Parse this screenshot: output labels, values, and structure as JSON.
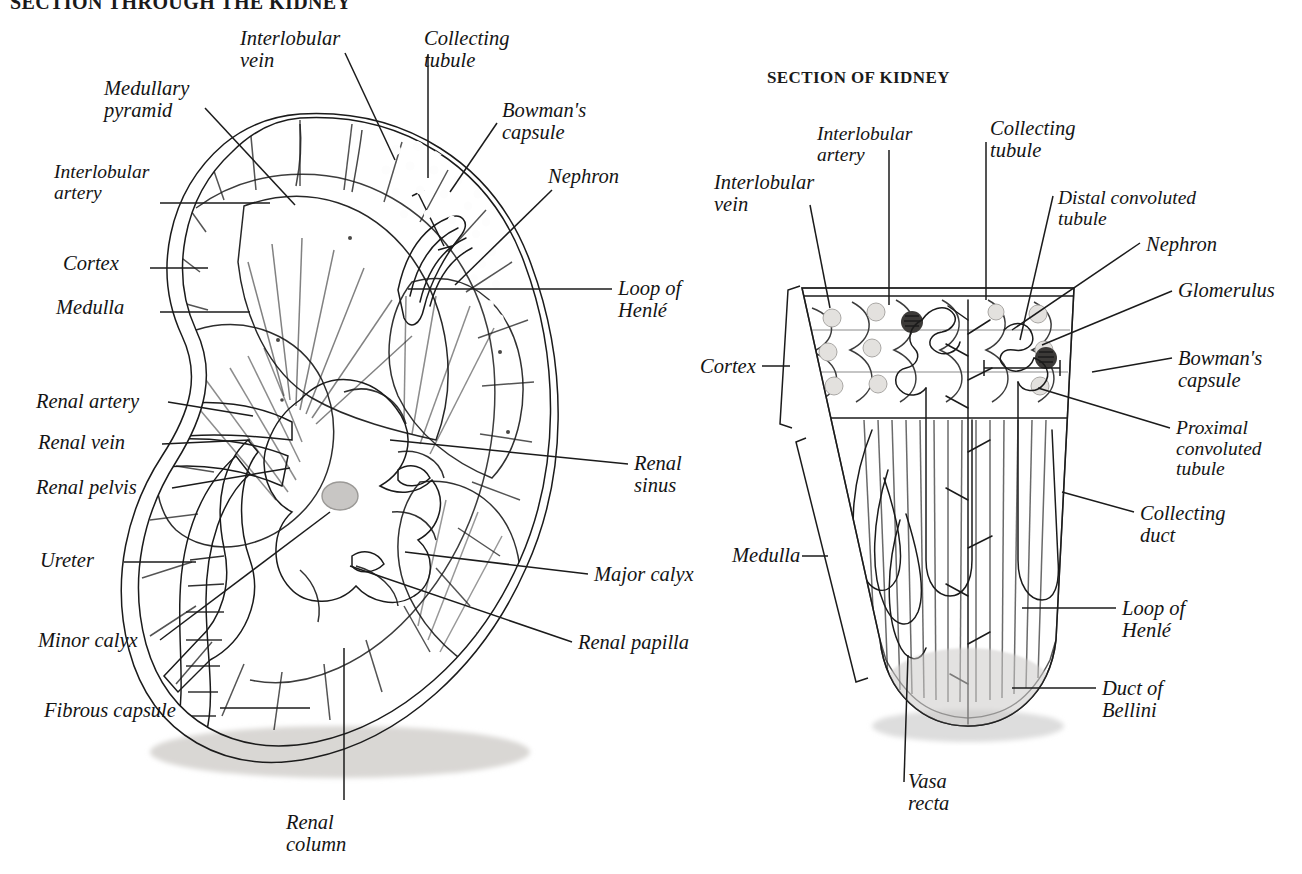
{
  "page": {
    "title_left": "SECTION THROUGH THE KIDNEY",
    "title_right": "SECTION OF KIDNEY",
    "background": "#ffffff",
    "ink": "#141414"
  },
  "left_figure": {
    "name": "whole-kidney-coronal-section",
    "labels": [
      {
        "id": "interlobular-vein",
        "text": "Interlobular\nvein",
        "x": 240,
        "y": 28,
        "align": "left"
      },
      {
        "id": "collecting-tubule",
        "text": "Collecting\ntubule",
        "x": 424,
        "y": 28,
        "align": "left"
      },
      {
        "id": "medullary-pyramid",
        "text": "Medullary\npyramid",
        "x": 104,
        "y": 78,
        "align": "left"
      },
      {
        "id": "bowmans-capsule",
        "text": "Bowman's\ncapsule",
        "x": 502,
        "y": 100,
        "align": "left"
      },
      {
        "id": "interlobular-artery",
        "text": "Interlobular\nartery",
        "x": 54,
        "y": 162,
        "align": "left"
      },
      {
        "id": "nephron",
        "text": "Nephron",
        "x": 548,
        "y": 166,
        "align": "left"
      },
      {
        "id": "cortex",
        "text": "Cortex",
        "x": 63,
        "y": 253,
        "align": "left"
      },
      {
        "id": "medulla",
        "text": "Medulla",
        "x": 56,
        "y": 297,
        "align": "left"
      },
      {
        "id": "loop-of-henle",
        "text": "Loop of\nHenlé",
        "x": 618,
        "y": 278,
        "align": "left"
      },
      {
        "id": "renal-artery",
        "text": "Renal artery",
        "x": 36,
        "y": 391,
        "align": "left"
      },
      {
        "id": "renal-vein",
        "text": "Renal vein",
        "x": 38,
        "y": 432,
        "align": "left"
      },
      {
        "id": "renal-sinus",
        "text": "Renal\nsinus",
        "x": 634,
        "y": 453,
        "align": "left"
      },
      {
        "id": "renal-pelvis",
        "text": "Renal pelvis",
        "x": 36,
        "y": 477,
        "align": "left"
      },
      {
        "id": "ureter",
        "text": "Ureter",
        "x": 40,
        "y": 550,
        "align": "left"
      },
      {
        "id": "major-calyx",
        "text": "Major calyx",
        "x": 594,
        "y": 564,
        "align": "left"
      },
      {
        "id": "minor-calyx",
        "text": "Minor calyx",
        "x": 38,
        "y": 630,
        "align": "left"
      },
      {
        "id": "renal-papilla",
        "text": "Renal papilla",
        "x": 578,
        "y": 632,
        "align": "left"
      },
      {
        "id": "fibrous-capsule",
        "text": "Fibrous capsule",
        "x": 44,
        "y": 700,
        "align": "left"
      },
      {
        "id": "renal-column",
        "text": "Renal\ncolumn",
        "x": 286,
        "y": 812,
        "align": "left"
      }
    ],
    "leaders": [
      {
        "for": "interlobular-vein",
        "points": "345,53 395,160"
      },
      {
        "for": "collecting-tubule",
        "points": "428,54 428,178"
      },
      {
        "for": "medullary-pyramid",
        "points": "205,108 295,205"
      },
      {
        "for": "bowmans-capsule",
        "points": "497,123 450,192"
      },
      {
        "for": "interlobular-artery",
        "points": "160,203 270,203"
      },
      {
        "for": "nephron",
        "points": "552,190 455,285"
      },
      {
        "for": "cortex",
        "points": "150,268 208,268"
      },
      {
        "for": "medulla",
        "points": "160,312 250,312"
      },
      {
        "for": "loop-of-henle",
        "points": "612,289 408,289"
      },
      {
        "for": "renal-artery",
        "points": "168,402 253,416"
      },
      {
        "for": "renal-vein",
        "points": "162,444 250,440"
      },
      {
        "for": "renal-sinus",
        "points": "628,464 390,440"
      },
      {
        "for": "renal-pelvis",
        "points": "172,488 290,468"
      },
      {
        "for": "ureter",
        "points": "124,562 196,562"
      },
      {
        "for": "major-calyx",
        "points": "588,574 405,552"
      },
      {
        "for": "minor-calyx",
        "points": "160,640 330,512"
      },
      {
        "for": "renal-papilla",
        "points": "572,642 350,566"
      },
      {
        "for": "fibrous-capsule",
        "points": "220,708 310,708"
      },
      {
        "for": "renal-column",
        "points": "344,800 344,648"
      }
    ]
  },
  "right_figure": {
    "name": "kidney-wedge-nephron-detail",
    "labels": [
      {
        "id": "interlobular-artery",
        "text": "Interlobular\nartery",
        "x": 817,
        "y": 124,
        "align": "left"
      },
      {
        "id": "collecting-tubule",
        "text": "Collecting\ntubule",
        "x": 990,
        "y": 118,
        "align": "left"
      },
      {
        "id": "distal-tubule",
        "text": "Distal convoluted\ntubule",
        "x": 1058,
        "y": 188,
        "align": "left"
      },
      {
        "id": "interlobular-vein",
        "text": "Interlobular\nvein",
        "x": 714,
        "y": 172,
        "align": "left"
      },
      {
        "id": "nephron",
        "text": "Nephron",
        "x": 1146,
        "y": 234,
        "align": "left"
      },
      {
        "id": "glomerulus",
        "text": "Glomerulus",
        "x": 1178,
        "y": 280,
        "align": "left"
      },
      {
        "id": "cortex",
        "text": "Cortex",
        "x": 700,
        "y": 356,
        "align": "left"
      },
      {
        "id": "bowmans-capsule",
        "text": "Bowman's\ncapsule",
        "x": 1178,
        "y": 348,
        "align": "left"
      },
      {
        "id": "proximal-tubule",
        "text": "Proximal\nconvoluted\ntubule",
        "x": 1176,
        "y": 418,
        "align": "left"
      },
      {
        "id": "collecting-duct",
        "text": "Collecting\nduct",
        "x": 1140,
        "y": 503,
        "align": "left"
      },
      {
        "id": "medulla",
        "text": "Medulla",
        "x": 732,
        "y": 545,
        "align": "left"
      },
      {
        "id": "loop-of-henle",
        "text": "Loop of\nHenlé",
        "x": 1122,
        "y": 598,
        "align": "left"
      },
      {
        "id": "duct-of-bellini",
        "text": "Duct of\nBellini",
        "x": 1102,
        "y": 678,
        "align": "left"
      },
      {
        "id": "vasa-recta",
        "text": "Vasa\nrecta",
        "x": 908,
        "y": 771,
        "align": "left"
      }
    ],
    "leaders": [
      {
        "for": "interlobular-artery",
        "points": "889,150 889,305"
      },
      {
        "for": "collecting-tubule",
        "points": "986,142 986,300"
      },
      {
        "for": "distal-tubule",
        "points": "1053,196 1020,340"
      },
      {
        "for": "interlobular-vein",
        "points": "810,205 830,308"
      },
      {
        "for": "nephron",
        "points": "1140,243 1012,330"
      },
      {
        "for": "glomerulus",
        "points": "1172,291 1042,345"
      },
      {
        "for": "bowmans-capsule",
        "points": "1172,358 1092,372"
      },
      {
        "for": "proximal-tubule",
        "points": "1170,428 1038,388"
      },
      {
        "for": "collecting-duct",
        "points": "1134,512 1062,492"
      },
      {
        "for": "loop-of-henle",
        "points": "1116,608 1022,608"
      },
      {
        "for": "duct-of-bellini",
        "points": "1096,688 1012,688"
      },
      {
        "for": "vasa-recta",
        "points": "904,782 908,655"
      },
      {
        "for": "cortex",
        "points": "762,366 790,366"
      },
      {
        "for": "medulla",
        "points": "802,556 828,556"
      }
    ],
    "brackets": [
      {
        "id": "cortex-bracket",
        "x": 790,
        "y1": 288,
        "y2": 430,
        "tilt": 14
      },
      {
        "id": "medulla-bracket",
        "x": 828,
        "y1": 440,
        "y2": 690,
        "tilt": 30
      }
    ],
    "nephron_scale_bracket": {
      "id": "nephron-span-bracket",
      "x1": 984,
      "x2": 1060,
      "y": 368
    }
  }
}
